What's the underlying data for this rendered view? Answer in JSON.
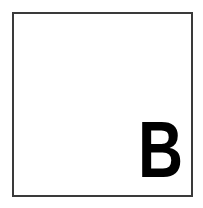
{
  "panel": {
    "label": "B",
    "border_color": "#3a3a3a",
    "text_color": "#000000",
    "background": "#ffffff"
  }
}
